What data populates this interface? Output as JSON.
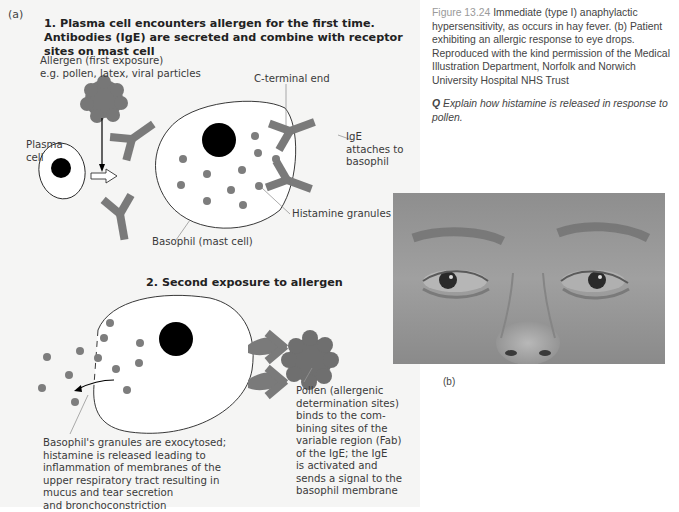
{
  "figure": {
    "panel_a_label": "(a)",
    "panel_b_label": "(b)",
    "step1_title": "1. Plasma cell encounters allergen for the first time. Antibodies (IgE) are secreted and combine with receptor sites on mast cell",
    "step2_title": "2. Second exposure to allergen",
    "labels": {
      "allergen_line1": "Allergen (first exposure)",
      "allergen_line2": "e.g. pollen, latex, viral particles",
      "plasma_line1": "Plasma",
      "plasma_line2": "cell",
      "c_terminal": "C-terminal end",
      "ige_line1": "IgE",
      "ige_line2": "attaches to",
      "ige_line3": "basophil",
      "histamine": "Histamine granules",
      "basophil": "Basophil (mast cell)",
      "exocytosis": [
        "Basophil's granules are exocytosed;",
        "histamine is released leading to",
        "inflammation of membranes of the",
        "upper respiratory tract resulting in",
        "mucus and tear secretion",
        "and bronchoconstriction"
      ],
      "pollen": [
        "Pollen (allergenic",
        "determination sites)",
        "binds to the com-",
        "bining sites of the",
        "variable region (Fab)",
        "of the IgE; the IgE",
        "is activated and",
        "sends a signal to the",
        "basophil membrane"
      ]
    }
  },
  "caption": {
    "figure_number": "Figure 13.24",
    "text": " Immediate (type I) anaphylactic hypersensitivity, as occurs in hay fever. (b) Patient exhibiting an allergic response to eye drops. Reproduced with the kind permission of the Medical Illustration Department, Norfolk and Norwich University Hospital NHS Trust",
    "question_marker": "Q",
    "question_text": " Explain how histamine is released in response to pollen."
  },
  "photo": {
    "description": "Close-up photograph of patient's eyes and nose showing allergic response"
  },
  "colors": {
    "antibody": "#7a7a7a",
    "granule": "#7d7d7d",
    "nucleus": "#000000",
    "panel_bg": "#f5f5f4",
    "figure_label": "#9a9a9a"
  }
}
